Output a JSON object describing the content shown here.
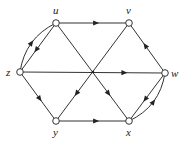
{
  "diagram": {
    "type": "directed-graph",
    "nodes": [
      {
        "id": "u",
        "label": "u",
        "x": 56,
        "y": 23,
        "lx": 53,
        "ly": 14
      },
      {
        "id": "v",
        "label": "v",
        "x": 129,
        "y": 23,
        "lx": 126,
        "ly": 14
      },
      {
        "id": "w",
        "label": "w",
        "x": 165,
        "y": 73,
        "lx": 171,
        "ly": 77
      },
      {
        "id": "x",
        "label": "x",
        "x": 129,
        "y": 121,
        "lx": 126,
        "ly": 136
      },
      {
        "id": "y",
        "label": "y",
        "x": 56,
        "y": 121,
        "lx": 53,
        "ly": 136
      },
      {
        "id": "z",
        "label": "z",
        "x": 20,
        "y": 72,
        "lx": 6,
        "ly": 76
      }
    ],
    "edges": [
      {
        "from": "u",
        "to": "v",
        "shape": "straight"
      },
      {
        "from": "y",
        "to": "x",
        "shape": "straight"
      },
      {
        "from": "z",
        "to": "w",
        "shape": "straight"
      },
      {
        "from": "u",
        "to": "z",
        "shape": "straight"
      },
      {
        "from": "z",
        "to": "u",
        "shape": "curved"
      },
      {
        "from": "z",
        "to": "y",
        "shape": "straight"
      },
      {
        "from": "v",
        "to": "y",
        "shape": "straight"
      },
      {
        "from": "u",
        "to": "x",
        "shape": "straight"
      },
      {
        "from": "w",
        "to": "v",
        "shape": "straight"
      },
      {
        "from": "w",
        "to": "x",
        "shape": "straight"
      },
      {
        "from": "x",
        "to": "w",
        "shape": "curved"
      }
    ]
  }
}
